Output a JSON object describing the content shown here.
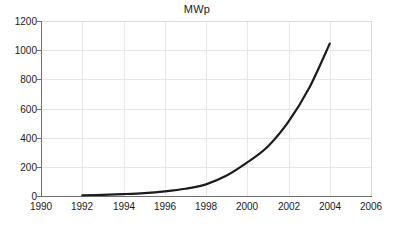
{
  "chart_data": {
    "type": "line",
    "title": "MWp",
    "xlabel": "",
    "ylabel": "",
    "xlim": [
      1990,
      2006
    ],
    "ylim": [
      0,
      1200
    ],
    "grid": true,
    "legend": false,
    "legend_position": "none",
    "line_color": "#1b1b1b",
    "grid_color": "#e6e6e6",
    "axis_color": "#6e6e6e",
    "background_color": "#ffffff",
    "xticks": [
      1990,
      1992,
      1994,
      1996,
      1998,
      2000,
      2002,
      2004,
      2006
    ],
    "xtick_labels": [
      "1990",
      "1992",
      "1994",
      "1996",
      "1998",
      "2000",
      "2002",
      "2004",
      "2006"
    ],
    "yticks": [
      0,
      200,
      400,
      600,
      800,
      1000,
      1200
    ],
    "ytick_labels": [
      "0",
      "200",
      "400",
      "600",
      "800",
      "1000",
      "1200"
    ],
    "series": [
      {
        "name": "MWp",
        "x": [
          1992,
          1993,
          1994,
          1995,
          1996,
          1997,
          1998,
          1999,
          2000,
          2001,
          2002,
          2003,
          2004
        ],
        "values": [
          5,
          8,
          13,
          20,
          32,
          50,
          80,
          140,
          230,
          340,
          510,
          740,
          1045
        ]
      }
    ]
  }
}
